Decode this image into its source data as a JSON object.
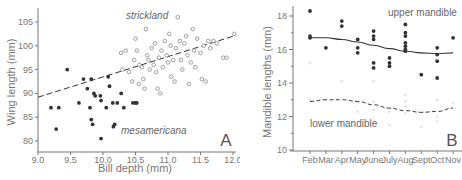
{
  "chart_data": [
    {
      "type": "scatter",
      "panel_label": "A",
      "xlabel": "Bill depth (mm)",
      "ylabel": "Wing length (mm)",
      "xlim": [
        9.0,
        12.0
      ],
      "ylim": [
        78,
        107
      ],
      "x_ticks": [
        "9.0",
        "9.5",
        "10.0",
        "10.5",
        "11.0",
        "11.5",
        "12.0"
      ],
      "y_ticks": [
        "80",
        "85",
        "90",
        "95",
        "100",
        "105"
      ],
      "grid": false,
      "annotations": [
        "strickland",
        "mesamericana"
      ],
      "trendline": {
        "style": "dashed",
        "from": [
          9.0,
          89.2
        ],
        "to": [
          12.0,
          102.0
        ]
      },
      "series": [
        {
          "name": "mesamericana",
          "marker": "filled",
          "points": [
            [
              9.2,
              87
            ],
            [
              9.28,
              82.5
            ],
            [
              9.32,
              87
            ],
            [
              9.45,
              95
            ],
            [
              9.63,
              88
            ],
            [
              9.7,
              93
            ],
            [
              9.76,
              91
            ],
            [
              9.8,
              87
            ],
            [
              9.82,
              93
            ],
            [
              9.82,
              84.5
            ],
            [
              9.84,
              83.5
            ],
            [
              9.86,
              90
            ],
            [
              9.88,
              89.5
            ],
            [
              9.96,
              89.5
            ],
            [
              9.97,
              88.5
            ],
            [
              9.97,
              80.5
            ],
            [
              10.05,
              87
            ],
            [
              10.08,
              93.5
            ],
            [
              10.1,
              91.5
            ],
            [
              10.15,
              88
            ],
            [
              10.16,
              83
            ],
            [
              10.18,
              83.5
            ],
            [
              10.22,
              88
            ],
            [
              10.28,
              90
            ],
            [
              10.32,
              87
            ],
            [
              10.46,
              88
            ],
            [
              10.5,
              88
            ],
            [
              10.52,
              88
            ]
          ]
        },
        {
          "name": "strickland",
          "marker": "open",
          "points": [
            [
              10.28,
              98.5
            ],
            [
              10.3,
              95
            ],
            [
              10.35,
              99
            ],
            [
              10.4,
              94.5
            ],
            [
              10.45,
              92.5
            ],
            [
              10.48,
              97
            ],
            [
              10.5,
              101.5
            ],
            [
              10.52,
              99
            ],
            [
              10.55,
              92
            ],
            [
              10.56,
              96
            ],
            [
              10.6,
              95.5
            ],
            [
              10.62,
              93
            ],
            [
              10.64,
              91
            ],
            [
              10.66,
              103.5
            ],
            [
              10.68,
              98
            ],
            [
              10.7,
              97
            ],
            [
              10.72,
              95
            ],
            [
              10.75,
              99.5
            ],
            [
              10.78,
              96
            ],
            [
              10.8,
              100.5
            ],
            [
              10.82,
              94.5
            ],
            [
              10.84,
              91
            ],
            [
              10.86,
              97.5
            ],
            [
              10.88,
              90
            ],
            [
              10.9,
              99
            ],
            [
              10.92,
              95.5
            ],
            [
              10.95,
              101
            ],
            [
              10.98,
              98
            ],
            [
              11.0,
              96.5
            ],
            [
              11.02,
              102.5
            ],
            [
              11.04,
              100
            ],
            [
              11.05,
              93.5
            ],
            [
              11.08,
              97
            ],
            [
              11.1,
              92.5
            ],
            [
              11.12,
              99.5
            ],
            [
              11.15,
              106
            ],
            [
              11.18,
              101
            ],
            [
              11.2,
              97
            ],
            [
              11.22,
              95
            ],
            [
              11.25,
              100.5
            ],
            [
              11.28,
              102
            ],
            [
              11.3,
              98
            ],
            [
              11.32,
              92
            ],
            [
              11.35,
              96.5
            ],
            [
              11.38,
              103.5
            ],
            [
              11.4,
              99
            ],
            [
              11.42,
              95.5
            ],
            [
              11.45,
              101.5
            ],
            [
              11.5,
              98.5
            ],
            [
              11.52,
              93
            ],
            [
              11.55,
              100
            ],
            [
              11.58,
              92.5
            ],
            [
              11.62,
              101
            ],
            [
              11.65,
              99.5
            ],
            [
              11.7,
              101
            ],
            [
              11.75,
              100.5
            ],
            [
              11.85,
              97.5
            ],
            [
              11.9,
              97.5
            ],
            [
              12.02,
              102.5
            ]
          ]
        }
      ]
    },
    {
      "type": "scatter",
      "panel_label": "B",
      "xlabel": "",
      "ylabel": "Mandible lengths (mm)",
      "ylim": [
        10,
        18.5
      ],
      "categories": [
        "Feb",
        "Mar",
        "Apr",
        "May",
        "June",
        "July",
        "Aug",
        "Sept",
        "Oct",
        "Nov"
      ],
      "y_ticks": [
        "10",
        "12",
        "14",
        "16",
        "18"
      ],
      "grid": false,
      "annotations": [
        "upper mandible",
        "lower mandible"
      ],
      "series": [
        {
          "name": "upper mandible",
          "marker": "filled",
          "points": {
            "Feb": [
              18.3,
              16.8,
              16.7
            ],
            "Mar": [
              16.1
            ],
            "Apr": [
              17.7,
              17.4
            ],
            "May": [
              16.6,
              16.1,
              15.8
            ],
            "June": [
              17.1,
              16.8,
              16.6,
              15.2,
              14.9
            ],
            "July": [
              15.5,
              15.2,
              15.0
            ],
            "Aug": [
              17.5,
              17.0,
              16.8,
              16.4,
              16.2,
              16.0,
              15.9
            ],
            "Sept": [
              14.5
            ],
            "Oct": [
              16.1,
              15.7,
              15.3,
              14.3
            ],
            "Nov": [
              16.7
            ]
          },
          "trend": {
            "style": "solid",
            "values": [
              16.7,
              16.7,
              16.6,
              16.45,
              16.25,
              16.05,
              15.9,
              15.8,
              15.75,
              15.8
            ]
          }
        },
        {
          "name": "lower mandible",
          "marker": "faint",
          "trend": {
            "style": "dashed",
            "values": [
              12.9,
              13.0,
              13.0,
              12.9,
              12.7,
              12.5,
              12.35,
              12.25,
              12.3,
              12.5
            ]
          }
        }
      ]
    }
  ],
  "labels": {
    "a": {
      "xlabel": "Bill depth (mm)",
      "ylabel": "Wing length (mm)",
      "panel": "A",
      "species_top": "strickland",
      "species_bottom": "mesamericana",
      "x_ticks": [
        "9.0",
        "9.5",
        "10.0",
        "10.5",
        "11.0",
        "11.5",
        "12.0"
      ],
      "y_ticks": [
        "80",
        "85",
        "90",
        "95",
        "100",
        "105"
      ]
    },
    "b": {
      "ylabel": "Mandible lengths (mm)",
      "panel": "B",
      "upper": "upper mandible",
      "lower": "lower mandible",
      "months": [
        "Feb",
        "Mar",
        "Apr",
        "May",
        "June",
        "July",
        "Aug",
        "Sept",
        "Oct",
        "Nov"
      ],
      "y_ticks": [
        "10",
        "12",
        "14",
        "16",
        "18"
      ]
    }
  },
  "colors": {
    "axis": "#777777",
    "filled_marker": "#333333",
    "open_marker": "#888888",
    "faint_marker": "#e6e6e6",
    "line": "#333333"
  }
}
